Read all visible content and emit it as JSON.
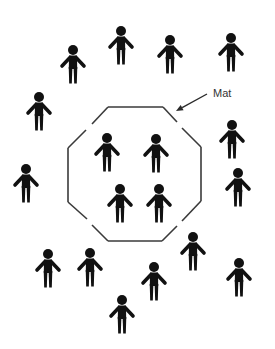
{
  "diagram": {
    "label": {
      "text": "Mat",
      "x": 213,
      "y": 97
    },
    "arrow": {
      "from": [
        207,
        94
      ],
      "to": [
        176,
        111
      ]
    },
    "mat": {
      "shape": "octagon",
      "stroke_color": "#3a3a3a",
      "segments": [
        [
          [
            108,
            107
          ],
          [
            163,
            107
          ]
        ],
        [
          [
            163,
            107
          ],
          [
            177,
            122
          ]
        ],
        [
          [
            182,
            128
          ],
          [
            201,
            147
          ]
        ],
        [
          [
            201,
            147
          ],
          [
            201,
            201
          ]
        ],
        [
          [
            201,
            201
          ],
          [
            182,
            221
          ]
        ],
        [
          [
            177,
            226
          ],
          [
            162,
            241
          ]
        ],
        [
          [
            162,
            241
          ],
          [
            108,
            241
          ]
        ],
        [
          [
            108,
            241
          ],
          [
            92,
            225
          ]
        ],
        [
          [
            87,
            219
          ],
          [
            68,
            202
          ]
        ],
        [
          [
            68,
            202
          ],
          [
            68,
            148
          ]
        ],
        [
          [
            68,
            148
          ],
          [
            86,
            130
          ]
        ],
        [
          [
            92,
            124
          ],
          [
            108,
            107
          ]
        ]
      ]
    },
    "figures_outside": [
      {
        "id": "outside-1",
        "x": 73,
        "y": 50
      },
      {
        "id": "outside-2",
        "x": 121,
        "y": 31
      },
      {
        "id": "outside-3",
        "x": 170,
        "y": 40
      },
      {
        "id": "outside-4",
        "x": 231,
        "y": 38
      },
      {
        "id": "outside-5",
        "x": 39,
        "y": 97
      },
      {
        "id": "outside-6",
        "x": 232,
        "y": 125
      },
      {
        "id": "outside-7",
        "x": 26,
        "y": 169
      },
      {
        "id": "outside-8",
        "x": 238,
        "y": 173
      },
      {
        "id": "outside-9",
        "x": 193,
        "y": 237
      },
      {
        "id": "outside-10",
        "x": 48,
        "y": 254
      },
      {
        "id": "outside-11",
        "x": 90,
        "y": 253
      },
      {
        "id": "outside-12",
        "x": 239,
        "y": 263
      },
      {
        "id": "outside-13",
        "x": 154,
        "y": 267
      },
      {
        "id": "outside-14",
        "x": 122,
        "y": 300
      }
    ],
    "figures_on_mat": [
      {
        "id": "mat-1",
        "x": 107,
        "y": 138
      },
      {
        "id": "mat-2",
        "x": 156,
        "y": 139
      },
      {
        "id": "mat-3",
        "x": 120,
        "y": 189
      },
      {
        "id": "mat-4",
        "x": 159,
        "y": 189
      }
    ],
    "figure_color": "#111111"
  }
}
